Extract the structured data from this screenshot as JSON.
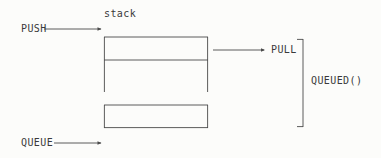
{
  "diagram": {
    "type": "line-diagram",
    "canvas": {
      "width": 381,
      "height": 158
    },
    "colors": {
      "background": "#fcfcfa",
      "stroke": "#4a4a4a",
      "text": "#3a3a3a"
    },
    "labels": {
      "stack": "stack",
      "push": "PUSH",
      "pull": "PULL",
      "queue": "QUEUE",
      "queued": "QUEUED()"
    },
    "shapes": {
      "upper_box": {
        "x": 104,
        "y": 37,
        "width": 104,
        "height": 55,
        "divider_y": 60,
        "open_bottom": true
      },
      "lower_box": {
        "x": 104,
        "y": 105,
        "width": 104,
        "height": 23,
        "closed": true
      },
      "brace": {
        "x": 303,
        "y_top": 39,
        "y_bottom": 127,
        "tick_length": 6,
        "facing": "left"
      }
    },
    "arrows": [
      {
        "name": "push-arrow",
        "label": "PUSH",
        "x1": 44,
        "y1": 29,
        "x2": 102,
        "y2": 29,
        "head": "right"
      },
      {
        "name": "pull-arrow",
        "label": "PULL",
        "x1": 213,
        "y1": 50,
        "x2": 265,
        "y2": 50,
        "head": "right"
      },
      {
        "name": "queue-arrow",
        "label": "QUEUE",
        "x1": 54,
        "y1": 143,
        "x2": 102,
        "y2": 143,
        "head": "right"
      }
    ]
  }
}
